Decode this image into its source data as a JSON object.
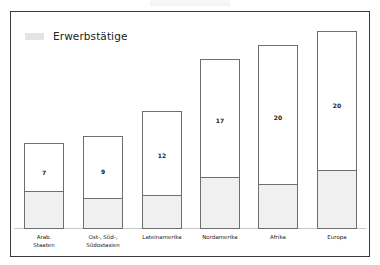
{
  "chart_data": {
    "type": "bar",
    "title": "",
    "xlabel": "",
    "ylabel": "",
    "grid": false,
    "legend_position": "top-left",
    "legend": [
      "Erwerbstätige"
    ],
    "categories": [
      "Arab. Staaten",
      "Ost-, Süd-, Südostasien",
      "Lateinamerika",
      "Nordamerika",
      "Afrika",
      "Europa"
    ],
    "values": [
      7,
      9,
      12,
      17,
      20,
      20
    ],
    "series": [
      {
        "name": "Erwerbstätige",
        "note": "shaded lower segment of each bar (unlabeled)"
      },
      {
        "name": "Total",
        "values": [
          7,
          9,
          12,
          17,
          20,
          20
        ]
      }
    ]
  },
  "legend": {
    "label": "Erwerbstätige",
    "swatch_color": "#e4e4e4"
  },
  "bars": [
    {
      "label": "Arab.\nStaaten",
      "value": "7",
      "left": 24,
      "top": 143,
      "fill_px": 36,
      "value_y": 25
    },
    {
      "label": "Ost-, Süd-,\nSüdostasien",
      "value": "9",
      "left": 83,
      "top": 136,
      "fill_px": 29,
      "value_y": 31
    },
    {
      "label": "Lateinamerika",
      "value": "12",
      "left": 142,
      "top": 111,
      "fill_px": 32,
      "value_y": 40
    },
    {
      "label": "Nordamerika",
      "value": "17",
      "left": 200,
      "top": 59,
      "fill_px": 50,
      "value_y": 57
    },
    {
      "label": "Afrika",
      "value": "20",
      "left": 258,
      "top": 45,
      "fill_px": 43,
      "value_y": 68
    },
    {
      "label": "Europa",
      "value": "20",
      "left": 317,
      "top": 31,
      "fill_px": 57,
      "value_y": 70
    }
  ],
  "colors": {
    "frame": "#3a3a3a",
    "bar_border": "#6e6e6e",
    "bar_fill": "#f0f0f0",
    "background": "#ffffff"
  }
}
